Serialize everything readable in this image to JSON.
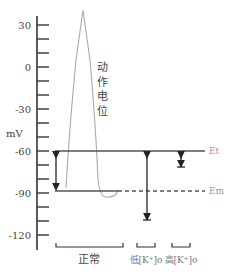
{
  "figure": {
    "y_axis": {
      "unit": "mV",
      "ticks": [
        {
          "label": "30",
          "value": 30
        },
        {
          "label": "0",
          "value": 0
        },
        {
          "label": "-30",
          "value": -30
        },
        {
          "label": "-60",
          "value": -60
        },
        {
          "label": "-90",
          "value": -90
        },
        {
          "label": "-120",
          "value": -120
        }
      ]
    },
    "curve_label": [
      "动",
      "作",
      "电",
      "位"
    ],
    "threshold_label": "Et",
    "resting_label": "Em",
    "groups": [
      {
        "label": "正常"
      },
      {
        "label": "低[K⁺]o"
      },
      {
        "label": "高[K⁺]o"
      }
    ]
  }
}
